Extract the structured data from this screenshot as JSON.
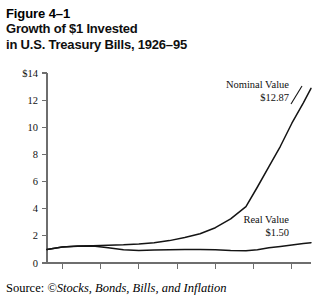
{
  "figure": {
    "number": "Figure 4–1",
    "title_line_1": "Growth of $1 Invested",
    "title_line_2": "in U.S. Treasury Bills, 1926–95"
  },
  "source": {
    "label": "Source: ",
    "citation": "©Stocks, Bonds, Bills, and Inflation"
  },
  "chart_data": {
    "type": "line",
    "title": "Growth of $1 Invested in U.S. Treasury Bills, 1926–95",
    "xlabel": "",
    "ylabel": "",
    "xlim": [
      1926,
      1995
    ],
    "ylim": [
      0,
      14
    ],
    "grid": false,
    "legend": "annotations",
    "y_ticks": [
      0,
      2,
      4,
      6,
      8,
      10,
      12,
      14
    ],
    "y_tick_labels": [
      "0",
      "2",
      "4",
      "6",
      "8",
      "10",
      "12",
      "$14"
    ],
    "x_ticks": [
      1930,
      1940,
      1950,
      1960,
      1970,
      1980,
      1990
    ],
    "x_tick_labels": [
      "1930",
      "1940",
      "1950",
      "1960",
      "1970",
      "1980",
      "1990"
    ],
    "annotations": [
      {
        "name": "Nominal Value",
        "value_label": "$12.87",
        "x": 1995,
        "y": 12.87
      },
      {
        "name": "Real Value",
        "value_label": "$1.50",
        "x": 1995,
        "y": 1.5
      }
    ],
    "series": [
      {
        "name": "Nominal Value",
        "end_value": 12.87,
        "x": [
          1926,
          1930,
          1934,
          1938,
          1942,
          1946,
          1950,
          1954,
          1958,
          1962,
          1966,
          1970,
          1974,
          1978,
          1981,
          1984,
          1987,
          1990,
          1993,
          1995
        ],
        "values": [
          1.0,
          1.18,
          1.25,
          1.28,
          1.31,
          1.34,
          1.4,
          1.5,
          1.65,
          1.88,
          2.15,
          2.6,
          3.25,
          4.15,
          5.6,
          7.1,
          8.6,
          10.3,
          11.8,
          12.87
        ]
      },
      {
        "name": "Real Value",
        "end_value": 1.5,
        "x": [
          1926,
          1930,
          1934,
          1938,
          1942,
          1946,
          1950,
          1954,
          1958,
          1962,
          1966,
          1970,
          1974,
          1978,
          1981,
          1984,
          1987,
          1990,
          1993,
          1995
        ],
        "values": [
          1.0,
          1.18,
          1.24,
          1.26,
          1.12,
          0.98,
          0.93,
          0.96,
          0.97,
          0.99,
          1.0,
          0.98,
          0.92,
          0.9,
          0.98,
          1.12,
          1.22,
          1.32,
          1.43,
          1.5
        ]
      }
    ]
  }
}
